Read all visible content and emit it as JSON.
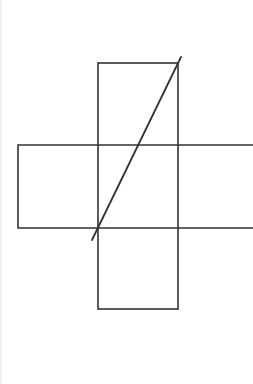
{
  "diagram": {
    "type": "cross-shaped net with diagonal",
    "stroke_color": "#333333",
    "background": "#ffffff",
    "vertical_strip": {
      "x": 98,
      "y": 63,
      "width": 80,
      "height": 246,
      "divider_ys": [
        145,
        228
      ]
    },
    "horizontal_strip": {
      "x": 18,
      "y": 145,
      "width": 235,
      "height": 83,
      "divider_xs": [
        98,
        178
      ],
      "open_right": true
    },
    "diagonal": {
      "x1": 181,
      "y1": 57,
      "x2": 92,
      "y2": 240
    }
  }
}
